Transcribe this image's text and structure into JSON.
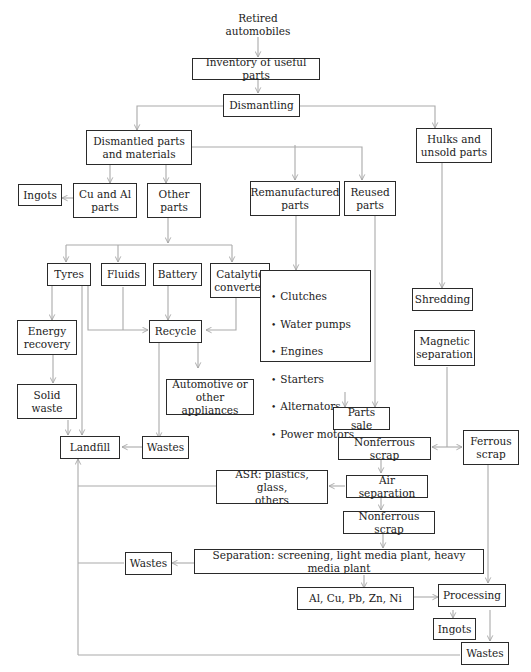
{
  "diagram": {
    "type": "flowchart",
    "colors": {
      "box_border": "#2a2a2a",
      "connector": "#a9a9a9",
      "text": "#222222",
      "background": "#ffffff"
    },
    "nodes": {
      "retired": "Retired\nautomobiles",
      "inventory": "Inventory of useful parts",
      "dismantling": "Dismantling",
      "dismantled_parts": "Dismantled parts\nand materials",
      "hulks": "Hulks and\nunsold parts",
      "ingots_top": "Ingots",
      "cu_al": "Cu and Al\nparts",
      "other_parts": "Other\nparts",
      "remanufactured": "Remanufactured\nparts",
      "reused": "Reused\nparts",
      "tyres": "Tyres",
      "fluids": "Fluids",
      "battery": "Battery",
      "catalytic": "Catalytic\nconverter",
      "shredding": "Shredding",
      "energy_recovery": "Energy\nrecovery",
      "recycle": "Recycle",
      "magnetic_separation": "Magnetic\nseparation",
      "solid_waste": "Solid\nwaste",
      "automotive": "Automotive or\nother appliances",
      "parts_sale": "Parts sale",
      "landfill": "Landfill",
      "wastes_mid": "Wastes",
      "nonferrous_1": "Nonferrous scrap",
      "ferrous": "Ferrous\nscrap",
      "asr": "ASR: plastics, glass,\nothers",
      "air_separation": "Air separation",
      "nonferrous_2": "Nonferrous scrap",
      "wastes_left": "Wastes",
      "separation": "Separation: screening, light media plant, heavy media plant",
      "metals": "Al, Cu, Pb, Zn, Ni",
      "processing": "Processing",
      "ingots_bottom": "Ingots",
      "wastes_bottom": "Wastes"
    },
    "remanufactured_items": [
      "Clutches",
      "Water pumps",
      "Engines",
      "Starters",
      "Alternators",
      "Power motors"
    ],
    "edges": [
      [
        "Retired automobiles",
        "Inventory of useful parts"
      ],
      [
        "Inventory of useful parts",
        "Dismantling"
      ],
      [
        "Dismantling",
        "Dismantled parts and materials"
      ],
      [
        "Dismantling",
        "Hulks and unsold parts"
      ],
      [
        "Dismantled parts and materials",
        "Cu and Al parts"
      ],
      [
        "Dismantled parts and materials",
        "Other parts"
      ],
      [
        "Dismantled parts and materials",
        "Remanufactured parts"
      ],
      [
        "Dismantled parts and materials",
        "Reused parts"
      ],
      [
        "Cu and Al parts",
        "Ingots"
      ],
      [
        "Other parts",
        "Tyres"
      ],
      [
        "Other parts",
        "Fluids"
      ],
      [
        "Other parts",
        "Battery"
      ],
      [
        "Other parts",
        "Catalytic converter"
      ],
      [
        "Tyres",
        "Energy recovery"
      ],
      [
        "Tyres",
        "Recycle"
      ],
      [
        "Tyres",
        "Landfill"
      ],
      [
        "Fluids",
        "Recycle"
      ],
      [
        "Battery",
        "Recycle"
      ],
      [
        "Catalytic converter",
        "Recycle"
      ],
      [
        "Energy recovery",
        "Solid waste"
      ],
      [
        "Solid waste",
        "Landfill"
      ],
      [
        "Recycle",
        "Automotive or other appliances"
      ],
      [
        "Recycle",
        "Wastes"
      ],
      [
        "Wastes",
        "Landfill"
      ],
      [
        "Remanufactured parts",
        "Remanufactured list"
      ],
      [
        "Remanufactured list",
        "Parts sale"
      ],
      [
        "Reused parts",
        "Parts sale"
      ],
      [
        "Hulks and unsold parts",
        "Shredding"
      ],
      [
        "Magnetic separation",
        "Nonferrous scrap"
      ],
      [
        "Magnetic separation",
        "Ferrous scrap"
      ],
      [
        "Nonferrous scrap",
        "Air separation"
      ],
      [
        "Air separation",
        "ASR: plastics, glass, others"
      ],
      [
        "ASR: plastics, glass, others",
        "Landfill"
      ],
      [
        "Air separation",
        "Nonferrous scrap (2)"
      ],
      [
        "Nonferrous scrap (2)",
        "Separation"
      ],
      [
        "Separation",
        "Wastes (left)"
      ],
      [
        "Wastes (left)",
        "Landfill"
      ],
      [
        "Separation",
        "Al, Cu, Pb, Zn, Ni"
      ],
      [
        "Al, Cu, Pb, Zn, Ni",
        "Processing"
      ],
      [
        "Ferrous scrap",
        "Processing"
      ],
      [
        "Processing",
        "Ingots"
      ],
      [
        "Processing",
        "Wastes (bottom)"
      ],
      [
        "Wastes (bottom)",
        "Landfill"
      ]
    ]
  }
}
